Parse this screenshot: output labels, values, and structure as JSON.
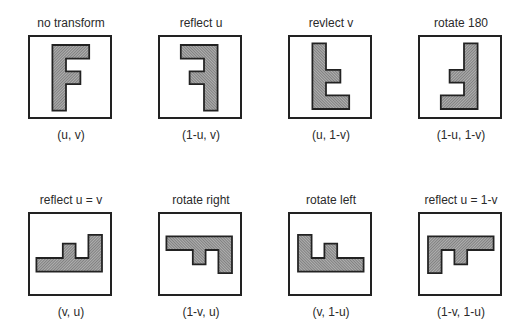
{
  "figure": {
    "shape_path": "M 0.28 0.10 L 0.74 0.10 L 0.74 0.27 L 0.45 0.27 L 0.45 0.43 L 0.63 0.43 L 0.63 0.59 L 0.45 0.59 L 0.45 0.92 L 0.28 0.92 Z",
    "fill_color": "#8a8a8a",
    "stroke_color": "#222222",
    "panels": [
      {
        "title": "no transform",
        "coord": "(u, v)",
        "transform": "matrix(1,0,0,1,0,0)",
        "left": 16,
        "top": 16
      },
      {
        "title": "reflect u",
        "coord": "(1-u, v)",
        "transform": "matrix(-1,0,0,1,1,0)",
        "left": 146,
        "top": 16
      },
      {
        "title": "revlect v",
        "coord": "(u, 1-v)",
        "transform": "matrix(1,0,0,-1,0,1)",
        "left": 276,
        "top": 16
      },
      {
        "title": "rotate 180",
        "coord": "(1-u, 1-v)",
        "transform": "matrix(-1,0,0,-1,1,1)",
        "left": 406,
        "top": 16
      },
      {
        "title": "reflect u = v",
        "coord": "(v, u)",
        "transform": "matrix(0,-1,-1,0,1,1)",
        "left": 16,
        "top": 193
      },
      {
        "title": "rotate right",
        "coord": "(1-v, u)",
        "transform": "matrix(0,1,-1,0,1,0)",
        "left": 146,
        "top": 193
      },
      {
        "title": "rotate left",
        "coord": "(v, 1-u)",
        "transform": "matrix(0,-1,1,0,0,1)",
        "left": 276,
        "top": 193
      },
      {
        "title": "reflect u = 1-v",
        "coord": "(1-v, 1-u)",
        "transform": "matrix(0,1,1,0,0,0)",
        "left": 406,
        "top": 193
      }
    ]
  }
}
